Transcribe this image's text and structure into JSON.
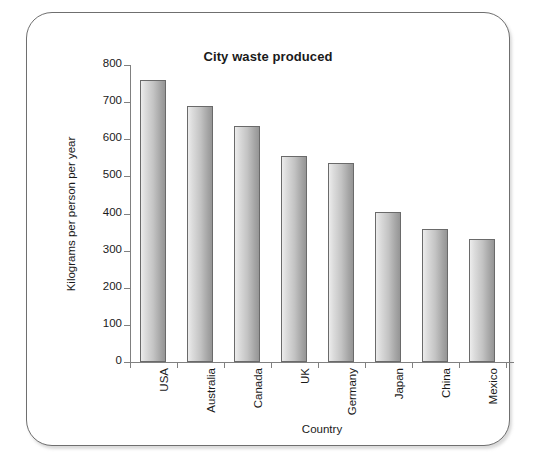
{
  "chart_data": {
    "type": "bar",
    "title": "City waste produced",
    "xlabel": "Country",
    "ylabel": "Kilograms per person per year",
    "categories": [
      "USA",
      "Australia",
      "Canada",
      "UK",
      "Germany",
      "Japan",
      "China",
      "Mexico"
    ],
    "values": [
      760,
      690,
      635,
      555,
      535,
      405,
      358,
      332
    ],
    "ylim": [
      0,
      800
    ],
    "yticks": [
      0,
      100,
      200,
      300,
      400,
      500,
      600,
      700,
      800
    ],
    "ytick_labels": [
      "0",
      "100",
      "200",
      "300",
      "400",
      "500",
      "600",
      "700",
      "800"
    ],
    "grid": false,
    "legend": "none",
    "bar_color_light": "#ececec",
    "bar_color_dark": "#959595",
    "bar_border_color": "#6a6a6a",
    "axis_color": "#808080",
    "frame_color": "#6f6f6f",
    "text_color": "#1a1a1a"
  }
}
